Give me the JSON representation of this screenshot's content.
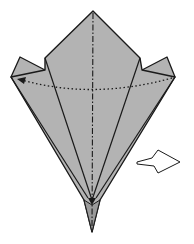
{
  "diagram": {
    "type": "origami-folding-step",
    "colors": {
      "paper": "#b3b3b3",
      "paper_dark": "#9a9a9a",
      "line": "#1a1a1a",
      "background": "#ffffff",
      "arrow_fill": "#ffffff"
    },
    "symbols": {
      "center_crease": "mountain-fold-line",
      "fold_arrow": "valley-fold-arrow-right-to-left",
      "next_step_arrow": "hollow-arrow-right"
    }
  }
}
